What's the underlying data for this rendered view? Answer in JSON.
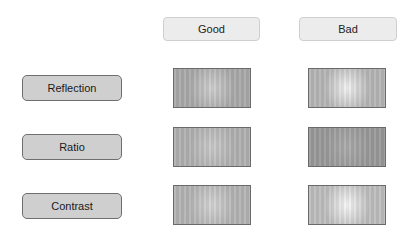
{
  "columns": [
    {
      "label": "Good"
    },
    {
      "label": "Bad"
    }
  ],
  "rows": [
    {
      "label": "Reflection"
    },
    {
      "label": "Ratio"
    },
    {
      "label": "Contrast"
    }
  ],
  "samples": [
    {
      "row": "Reflection",
      "column": "Good",
      "base": "#a9a9a9",
      "highlight": "#cfcfcf"
    },
    {
      "row": "Reflection",
      "column": "Bad",
      "base": "#b5b5b5",
      "highlight": "#f2f2f2"
    },
    {
      "row": "Ratio",
      "column": "Good",
      "base": "#b0b0b0",
      "highlight": "#cacaca"
    },
    {
      "row": "Ratio",
      "column": "Bad",
      "base": "#999999",
      "highlight": "#ababab"
    },
    {
      "row": "Contrast",
      "column": "Good",
      "base": "#b3b3b3",
      "highlight": "#d4d4d4"
    },
    {
      "row": "Contrast",
      "column": "Bad",
      "base": "#bdbdbd",
      "highlight": "#f7f7f7"
    }
  ]
}
